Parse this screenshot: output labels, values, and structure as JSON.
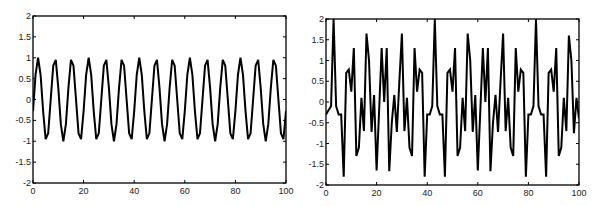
{
  "chart_data": [
    {
      "type": "line",
      "title": "",
      "xlabel": "",
      "ylabel": "",
      "xlim": [
        0,
        100
      ],
      "ylim": [
        -2,
        2
      ],
      "grid": false,
      "legend": null,
      "x_ticks": [
        "0",
        "20",
        "40",
        "60",
        "80",
        "100"
      ],
      "y_ticks": [
        "2",
        "1.5",
        "1",
        "0.5",
        "0",
        "-0.5",
        "-1",
        "-1.5",
        "-2"
      ],
      "series": [
        {
          "name": "sinusoid",
          "description": "sampled sinusoid, amplitude ~1, period ~6.67 samples (15 cycles over 0-100)",
          "x": [
            0,
            1,
            2,
            3,
            4,
            5,
            6,
            7,
            8,
            9,
            10,
            11,
            12,
            13,
            14,
            15,
            16,
            17,
            18,
            19,
            20,
            21,
            22,
            23,
            24,
            25,
            26,
            27,
            28,
            29,
            30,
            31,
            32,
            33,
            34,
            35,
            36,
            37,
            38,
            39,
            40,
            41,
            42,
            43,
            44,
            45,
            46,
            47,
            48,
            49,
            50,
            51,
            52,
            53,
            54,
            55,
            56,
            57,
            58,
            59,
            60,
            61,
            62,
            63,
            64,
            65,
            66,
            67,
            68,
            69,
            70,
            71,
            72,
            73,
            74,
            75,
            76,
            77,
            78,
            79,
            80,
            81,
            82,
            83,
            84,
            85,
            86,
            87,
            88,
            89,
            90,
            91,
            92,
            93,
            94,
            95,
            96,
            97,
            98,
            99,
            100
          ],
          "values": [
            -0.28,
            0.59,
            1.0,
            0.59,
            -0.28,
            -0.95,
            -0.81,
            0.0,
            0.81,
            0.95,
            0.28,
            -0.59,
            -1.0,
            -0.59,
            0.28,
            0.95,
            0.81,
            0.0,
            -0.81,
            -0.95,
            -0.28,
            0.59,
            1.0,
            0.59,
            -0.28,
            -0.95,
            -0.81,
            0.0,
            0.81,
            0.95,
            0.28,
            -0.59,
            -1.0,
            -0.59,
            0.28,
            0.95,
            0.81,
            0.0,
            -0.81,
            -0.95,
            -0.28,
            0.59,
            1.0,
            0.59,
            -0.28,
            -0.95,
            -0.81,
            0.0,
            0.81,
            0.95,
            0.28,
            -0.59,
            -1.0,
            -0.59,
            0.28,
            0.95,
            0.81,
            0.0,
            -0.81,
            -0.95,
            -0.28,
            0.59,
            1.0,
            0.59,
            -0.28,
            -0.95,
            -0.81,
            0.0,
            0.81,
            0.95,
            0.28,
            -0.59,
            -1.0,
            -0.59,
            0.28,
            0.95,
            0.81,
            0.0,
            -0.81,
            -0.95,
            -0.28,
            0.59,
            1.0,
            0.59,
            -0.28,
            -0.95,
            -0.81,
            0.0,
            0.81,
            0.95,
            0.28,
            -0.59,
            -1.0,
            -0.59,
            0.28,
            0.95,
            0.81,
            0.0,
            -0.81,
            -0.95,
            -0.28
          ]
        }
      ]
    },
    {
      "type": "line",
      "title": "",
      "xlabel": "",
      "ylabel": "",
      "xlim": [
        0,
        100
      ],
      "ylim": [
        -2,
        2
      ],
      "grid": false,
      "legend": null,
      "x_ticks": [
        "0",
        "20",
        "40",
        "60",
        "80",
        "100"
      ],
      "y_ticks": [
        "2",
        "1.5",
        "1",
        "0.5",
        "0",
        "-0.5",
        "-1",
        "-1.5",
        "-2"
      ],
      "series": [
        {
          "name": "composite signal",
          "description": "periodic multi-tone signal, period ~40 samples, sharp spikes to 2 at x≈3, 43, 83",
          "x": [
            0,
            1,
            2,
            3,
            4,
            5,
            6,
            7,
            8,
            9,
            10,
            11,
            12,
            13,
            14,
            15,
            16,
            17,
            18,
            19,
            20,
            21,
            22,
            23,
            24,
            25,
            26,
            27,
            28,
            29,
            30,
            31,
            32,
            33,
            34,
            35,
            36,
            37,
            38,
            39,
            40,
            41,
            42,
            43,
            44,
            45,
            46,
            47,
            48,
            49,
            50,
            51,
            52,
            53,
            54,
            55,
            56,
            57,
            58,
            59,
            60,
            61,
            62,
            63,
            64,
            65,
            66,
            67,
            68,
            69,
            70,
            71,
            72,
            73,
            74,
            75,
            76,
            77,
            78,
            79,
            80,
            81,
            82,
            83,
            84,
            85,
            86,
            87,
            88,
            89,
            90,
            91,
            92,
            93,
            94,
            95,
            96,
            97,
            98,
            99,
            100
          ],
          "values": [
            -0.3,
            -0.2,
            -0.1,
            2.0,
            -0.1,
            -0.3,
            -0.3,
            -1.8,
            0.7,
            0.78,
            0.25,
            1.3,
            -1.3,
            -1.1,
            0.1,
            -0.7,
            1.65,
            1.0,
            -0.72,
            0.17,
            -1.65,
            -0.2,
            1.3,
            0.0,
            1.3,
            -1.67,
            -0.5,
            0.17,
            -0.72,
            0.5,
            1.65,
            -0.7,
            0.1,
            -1.1,
            -1.3,
            1.3,
            0.25,
            0.78,
            0.7,
            -1.8,
            -0.3,
            -0.3,
            -0.1,
            2.0,
            -0.1,
            -0.3,
            -0.3,
            -1.8,
            0.7,
            0.78,
            0.25,
            1.3,
            -1.3,
            -1.1,
            0.1,
            -0.7,
            1.65,
            1.0,
            -0.72,
            0.17,
            -1.65,
            -0.2,
            1.3,
            0.0,
            1.3,
            -1.67,
            -0.5,
            0.17,
            -0.72,
            0.5,
            1.65,
            -0.7,
            0.1,
            -1.1,
            -1.3,
            1.3,
            0.25,
            0.78,
            0.7,
            -1.8,
            -0.3,
            -0.3,
            -0.1,
            2.0,
            -0.1,
            -0.3,
            -0.3,
            -1.8,
            0.7,
            0.78,
            0.25,
            1.3,
            -1.3,
            -1.1,
            0.1,
            -0.7,
            1.6,
            1.0,
            -0.75,
            0.1,
            -0.4
          ]
        }
      ]
    }
  ],
  "layout": {
    "plots": [
      {
        "left": 33,
        "top": 16,
        "right": 286,
        "bottom": 183
      },
      {
        "left": 326,
        "top": 19,
        "right": 579,
        "bottom": 185
      }
    ],
    "line_color": "#000000",
    "axis_color": "#000000"
  }
}
